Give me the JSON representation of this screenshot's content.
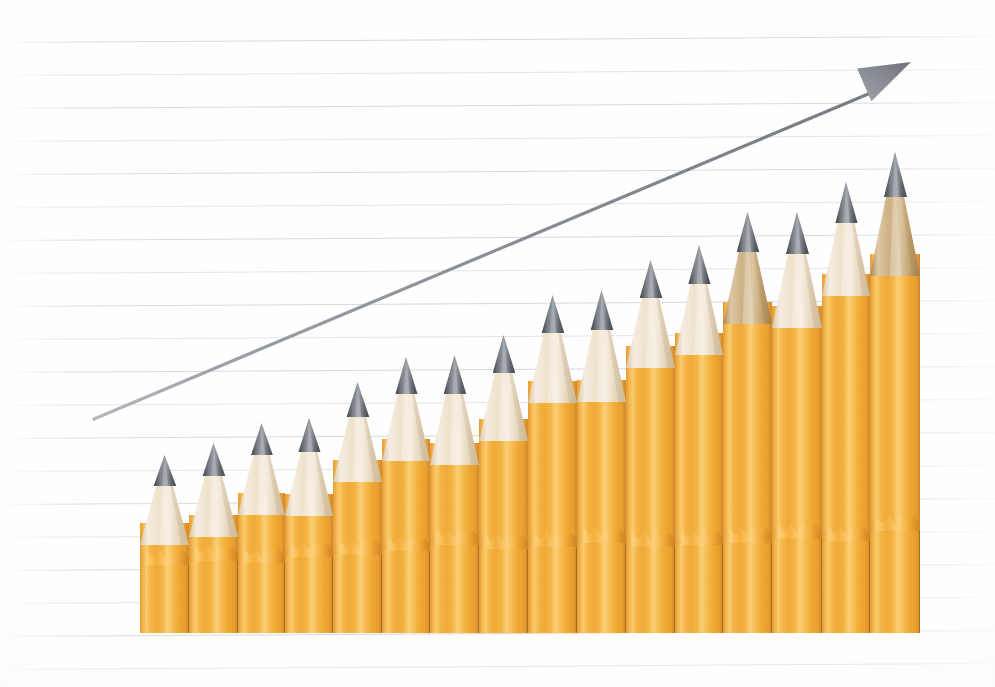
{
  "scene": {
    "title": "Pencil bar chart with rising trend arrow",
    "width": 995,
    "height": 687,
    "background_color": "#ffffff",
    "paper_color": "#fefefe",
    "rule_line_color": "#cdd3da",
    "rule_line_count": 20,
    "rule_line_spacing": 33,
    "rule_line_first_y": 42,
    "rule_line_tilt_deg": -0.35
  },
  "arrow": {
    "name": "growth-trend-arrow",
    "color": "#8f949a",
    "shaft_start_x": 94,
    "shaft_start_y": 419,
    "shaft_end_x": 873,
    "shaft_end_y": 92,
    "head_tip_x": 911,
    "head_tip_y": 62,
    "head_length": 52,
    "head_width": 40,
    "stroke_width": 3.2
  },
  "chart_data": {
    "type": "bar",
    "xlabel": "",
    "ylabel": "",
    "grid": true,
    "legend": "none",
    "baseline_y": 633,
    "bar_pitch": 48.7,
    "bar_first_left": 140,
    "categories": [
      "1",
      "2",
      "3",
      "4",
      "5",
      "6",
      "7",
      "8",
      "9",
      "10",
      "11",
      "12",
      "13",
      "14",
      "15",
      "16"
    ],
    "values": [
      178,
      190,
      210,
      215,
      251,
      276,
      278,
      298,
      338,
      343,
      373,
      388,
      421,
      421,
      451,
      481
    ],
    "tip_y": [
      455,
      443,
      423,
      418,
      382,
      357,
      355,
      335,
      295,
      290,
      260,
      245,
      212,
      212,
      182,
      152
    ],
    "ylim": [
      0,
      520
    ],
    "series": [
      {
        "name": "Pencil height",
        "values": [
          178,
          190,
          210,
          215,
          251,
          276,
          278,
          298,
          338,
          343,
          373,
          388,
          421,
          421,
          451,
          481
        ]
      }
    ]
  },
  "pencils": {
    "body_color": "#f6b63f",
    "body_highlight": "#fdd178",
    "body_shadow": "#e0922a",
    "wood_color": "#efe2cc",
    "wood_shadow": "#d8c5a4",
    "wood_dark_color": "#c9a878",
    "lead_color": "#6e7378",
    "lead_dark": "#4c5157",
    "count": 16,
    "items": [
      {
        "name": "pencil-bar-01",
        "left": 140,
        "width": 49,
        "tip_y": 455,
        "cone_h": 78,
        "wood": "light"
      },
      {
        "name": "pencil-bar-02",
        "left": 189,
        "width": 49,
        "tip_y": 443,
        "cone_h": 82,
        "wood": "light"
      },
      {
        "name": "pencil-bar-03",
        "left": 238,
        "width": 47,
        "tip_y": 423,
        "cone_h": 80,
        "wood": "light"
      },
      {
        "name": "pencil-bar-04",
        "left": 285,
        "width": 48,
        "tip_y": 418,
        "cone_h": 86,
        "wood": "light"
      },
      {
        "name": "pencil-bar-05",
        "left": 333,
        "width": 49,
        "tip_y": 382,
        "cone_h": 88,
        "wood": "light"
      },
      {
        "name": "pencil-bar-06",
        "left": 382,
        "width": 48,
        "tip_y": 357,
        "cone_h": 92,
        "wood": "light"
      },
      {
        "name": "pencil-bar-07",
        "left": 430,
        "width": 49,
        "tip_y": 355,
        "cone_h": 98,
        "wood": "light"
      },
      {
        "name": "pencil-bar-08",
        "left": 479,
        "width": 49,
        "tip_y": 335,
        "cone_h": 94,
        "wood": "light"
      },
      {
        "name": "pencil-bar-09",
        "left": 528,
        "width": 49,
        "tip_y": 295,
        "cone_h": 96,
        "wood": "light"
      },
      {
        "name": "pencil-bar-10",
        "left": 577,
        "width": 49,
        "tip_y": 290,
        "cone_h": 100,
        "wood": "light"
      },
      {
        "name": "pencil-bar-11",
        "left": 626,
        "width": 49,
        "tip_y": 260,
        "cone_h": 96,
        "wood": "light"
      },
      {
        "name": "pencil-bar-12",
        "left": 675,
        "width": 48,
        "tip_y": 245,
        "cone_h": 98,
        "wood": "light"
      },
      {
        "name": "pencil-bar-13",
        "left": 723,
        "width": 49,
        "tip_y": 212,
        "cone_h": 100,
        "wood": "dark"
      },
      {
        "name": "pencil-bar-14",
        "left": 772,
        "width": 50,
        "tip_y": 212,
        "cone_h": 104,
        "wood": "light"
      },
      {
        "name": "pencil-bar-15",
        "left": 822,
        "width": 48,
        "tip_y": 182,
        "cone_h": 102,
        "wood": "light"
      },
      {
        "name": "pencil-bar-16",
        "left": 870,
        "width": 50,
        "tip_y": 152,
        "cone_h": 112,
        "wood": "dark"
      }
    ]
  }
}
